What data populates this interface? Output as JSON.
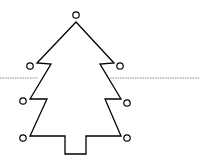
{
  "diagram": {
    "type": "christmas-tree-outline",
    "stroke_color": "#000000",
    "background": "#ffffff",
    "dotted_line_color": "#888888",
    "tree_outline_points": [
      [
        76,
        22
      ],
      [
        114,
        63
      ],
      [
        100,
        64
      ],
      [
        121,
        99
      ],
      [
        105,
        99
      ],
      [
        121,
        136
      ],
      [
        86,
        136
      ],
      [
        86,
        154
      ],
      [
        65,
        154
      ],
      [
        65,
        136
      ],
      [
        30,
        136
      ],
      [
        47,
        99
      ],
      [
        30,
        99
      ],
      [
        51,
        64
      ],
      [
        37,
        63
      ]
    ],
    "ornaments": [
      {
        "name": "top",
        "cx": 76,
        "cy": 15,
        "r": 3.2
      },
      {
        "name": "tier1-left",
        "cx": 30,
        "cy": 66,
        "r": 3.2
      },
      {
        "name": "tier1-right",
        "cx": 120,
        "cy": 66,
        "r": 3.2
      },
      {
        "name": "tier2-left",
        "cx": 23,
        "cy": 101,
        "r": 3.2
      },
      {
        "name": "tier2-right",
        "cx": 127,
        "cy": 103,
        "r": 3.2
      },
      {
        "name": "tier3-left",
        "cx": 23,
        "cy": 138,
        "r": 3.2
      },
      {
        "name": "tier3-right",
        "cx": 127,
        "cy": 138,
        "r": 3.2
      }
    ],
    "dotted_line": {
      "y": 78,
      "segments": [
        [
          0,
          38
        ],
        [
          110,
          200
        ]
      ]
    }
  }
}
